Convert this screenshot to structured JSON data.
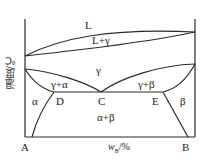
{
  "diagram": {
    "type": "binary phase diagram (eutectoid)",
    "y_axis_label": "温度/℃",
    "x_axis_label": "w_B/%",
    "x_axis_label_main": "w",
    "x_axis_label_sub": "B",
    "x_axis_label_unit": "/%",
    "left_component": "A",
    "right_component": "B",
    "regions": {
      "liquid": "L",
      "liquid_gamma": "L+γ",
      "gamma": "γ",
      "gamma_alpha": "γ+α",
      "gamma_beta": "γ+β",
      "alpha": "α",
      "beta": "β",
      "alpha_beta": "α+β"
    },
    "points": {
      "D": "D",
      "C": "C",
      "E": "E"
    },
    "colors": {
      "line": "#2a2a2a",
      "text": "#222222"
    }
  }
}
